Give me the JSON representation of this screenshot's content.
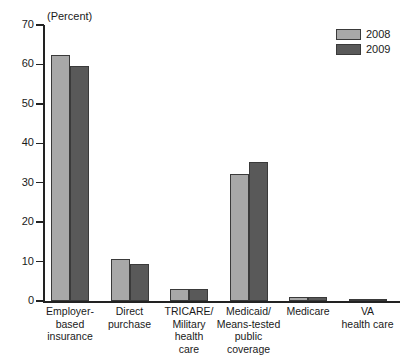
{
  "chart_data": {
    "type": "bar",
    "title": "",
    "subtitle": "",
    "axis_note": "(Percent)",
    "xlabel": "",
    "ylabel": "",
    "ylim": [
      0,
      70
    ],
    "ytick_values": [
      0,
      10,
      20,
      30,
      40,
      50,
      60,
      70
    ],
    "ytick_labels": [
      "0",
      "10",
      "20",
      "30",
      "40",
      "50",
      "60",
      "70"
    ],
    "grid": false,
    "legend_position": "top-right",
    "categories": [
      "Employer-\nbased\ninsurance",
      "Direct\npurchase",
      "TRICARE/\nMilitary\nhealth\ncare",
      "Medicaid/\nMeans-tested\npublic\ncoverage",
      "Medicare",
      "VA\nhealth care"
    ],
    "category_labels": [
      [
        "Employer-",
        "based",
        "insurance"
      ],
      [
        "Direct",
        "purchase"
      ],
      [
        "TRICARE/",
        "Military",
        "health",
        "care"
      ],
      [
        "Medicaid/",
        "Means-tested",
        "public",
        "coverage"
      ],
      [
        "Medicare"
      ],
      [
        "VA",
        "health care"
      ]
    ],
    "series": [
      {
        "name": "2008",
        "color": "#a8a8a8",
        "values": [
          62.4,
          10.7,
          3.0,
          32.2,
          1.0,
          0.4
        ]
      },
      {
        "name": "2009",
        "color": "#595959",
        "values": [
          59.5,
          9.3,
          3.1,
          35.2,
          1.1,
          0.4
        ]
      }
    ]
  },
  "legend": {
    "entries": [
      {
        "label": "2008",
        "color": "#a8a8a8"
      },
      {
        "label": "2009",
        "color": "#595959"
      }
    ]
  }
}
